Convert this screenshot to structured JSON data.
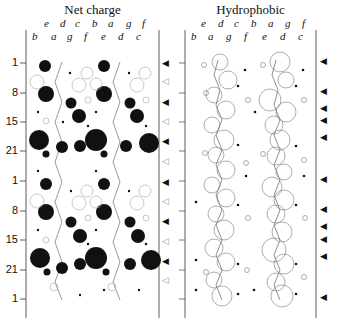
{
  "panels": [
    {
      "title": "Net charge",
      "heptad_top": [
        "e",
        "d",
        "c",
        "b",
        "a",
        "g",
        "f"
      ],
      "heptad_bottom": [
        "b",
        "a",
        "g",
        "f",
        "e",
        "d",
        "c"
      ]
    },
    {
      "title": "Hydrophobic",
      "heptad_top": [
        "e",
        "d",
        "c",
        "b",
        "a",
        "g",
        "f"
      ],
      "heptad_bottom": [
        "b",
        "a",
        "g",
        "f",
        "e",
        "d",
        "c"
      ]
    }
  ],
  "y_axis": {
    "tick_labels": [
      "1",
      "8",
      "15",
      "21",
      "1",
      "8",
      "15",
      "21",
      "1"
    ],
    "tick_y": [
      63,
      93,
      122,
      151,
      181,
      211,
      240,
      270,
      299
    ]
  },
  "markers": {
    "net_charge_right": [
      {
        "y": 64,
        "type": "filled"
      },
      {
        "y": 82,
        "type": "open"
      },
      {
        "y": 103,
        "type": "filled"
      },
      {
        "y": 122,
        "type": "open"
      },
      {
        "y": 142,
        "type": "filled"
      },
      {
        "y": 162,
        "type": "open"
      },
      {
        "y": 183,
        "type": "filled"
      },
      {
        "y": 202,
        "type": "open"
      },
      {
        "y": 222,
        "type": "filled"
      },
      {
        "y": 242,
        "type": "open"
      },
      {
        "y": 262,
        "type": "filled"
      },
      {
        "y": 281,
        "type": "open"
      }
    ],
    "hydrophobic_right": [
      {
        "y": 62,
        "type": "filled"
      },
      {
        "y": 92,
        "type": "filled"
      },
      {
        "y": 109,
        "type": "filled"
      },
      {
        "y": 121,
        "type": "filled"
      },
      {
        "y": 138,
        "type": "filled"
      },
      {
        "y": 180,
        "type": "filled"
      },
      {
        "y": 210,
        "type": "filled"
      },
      {
        "y": 227,
        "type": "filled"
      },
      {
        "y": 240,
        "type": "filled"
      },
      {
        "y": 257,
        "type": "filled"
      },
      {
        "y": 298,
        "type": "filled"
      }
    ]
  },
  "legend_symbols": {
    "filled_triangle": "◀",
    "open_triangle": "◁"
  },
  "colors": {
    "ink": "#111111",
    "faint": "#9a9a9a",
    "background": "#ffffff"
  }
}
